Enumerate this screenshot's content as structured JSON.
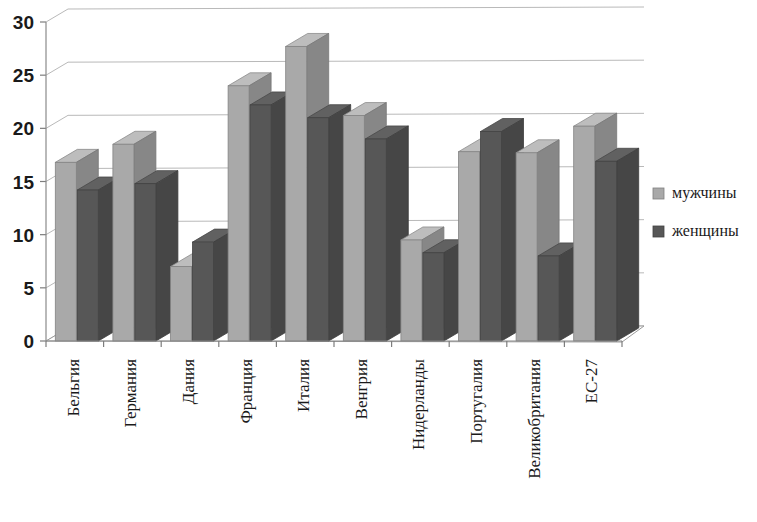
{
  "chart_data": {
    "type": "bar",
    "title": "",
    "subtitle": "",
    "xlabel": "",
    "ylabel": "",
    "ylim": [
      0,
      30
    ],
    "ytick_values": [
      0,
      5,
      10,
      15,
      20,
      25,
      30
    ],
    "ytick_labels": [
      "0",
      "5",
      "10",
      "15",
      "20",
      "25",
      "30"
    ],
    "grid": true,
    "legend_position": "right",
    "style": "3d-clustered-column",
    "categories": [
      "Бельгия",
      "Германия",
      "Дания",
      "Франция",
      "Италия",
      "Венгрия",
      "Нидерланды",
      "Португалия",
      "Великобритания",
      "ЕС-27"
    ],
    "series": [
      {
        "name": "мужчины",
        "color": "#a9a9a9",
        "values": [
          16.8,
          18.5,
          7.0,
          24.0,
          27.7,
          21.2,
          9.5,
          17.8,
          17.7,
          20.2
        ]
      },
      {
        "name": "женщины",
        "color": "#575757",
        "values": [
          14.2,
          14.8,
          9.3,
          22.2,
          21.0,
          19.0,
          8.3,
          19.7,
          8.0,
          16.9
        ]
      }
    ]
  },
  "legend": {
    "items": [
      {
        "label": "мужчины",
        "color": "#a9a9a9"
      },
      {
        "label": "женщины",
        "color": "#575757"
      }
    ]
  },
  "colors": {
    "series_light": "#a9a9a9",
    "series_dark": "#575757",
    "gridline": "#b9b9b9",
    "axis": "#8a8a8a",
    "text": "#1a1a1a",
    "background": "#ffffff"
  }
}
